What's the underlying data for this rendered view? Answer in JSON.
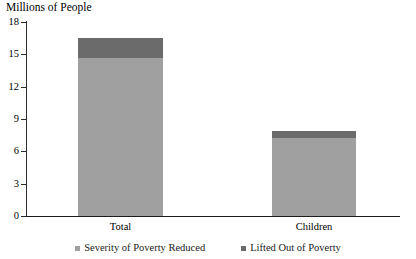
{
  "chart_data": {
    "type": "bar",
    "title": "Millions of People",
    "subtitle": "",
    "xlabel": "",
    "ylabel": "Millions of People",
    "stacked": true,
    "grid": false,
    "legend_position": "bottom",
    "ylim": [
      0,
      18
    ],
    "yticks": [
      0,
      3,
      6,
      9,
      12,
      15,
      18
    ],
    "ytick_labels": [
      "0",
      "3",
      "6",
      "9",
      "12",
      "15",
      "18"
    ],
    "categories": [
      "Total",
      "Children"
    ],
    "series": [
      {
        "name": "Severity of Poverty Reduced",
        "color": "#a0a0a0",
        "values": [
          14.7,
          7.2
        ]
      },
      {
        "name": "Lifted Out of Poverty",
        "color": "#6b6b6b",
        "values": [
          1.8,
          0.7
        ]
      }
    ],
    "totals": [
      16.5,
      7.9
    ]
  },
  "legend": {
    "items": [
      {
        "label": "Severity of Poverty Reduced",
        "color": "#a0a0a0"
      },
      {
        "label": "Lifted Out of Poverty",
        "color": "#6b6b6b"
      }
    ]
  },
  "axis": {
    "y_labels": [
      "18",
      "15",
      "12",
      "9",
      "6",
      "3",
      "0"
    ],
    "x_labels": [
      "Total",
      "Children"
    ]
  }
}
